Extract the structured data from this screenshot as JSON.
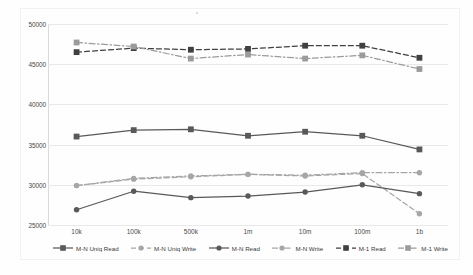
{
  "chart_data": {
    "type": "line",
    "title": "",
    "xlabel": "",
    "ylabel": "",
    "categories": [
      "10k",
      "100k",
      "500k",
      "1m",
      "10m",
      "100m",
      "1b"
    ],
    "ylim": [
      25000,
      50000
    ],
    "yticks": [
      25000,
      30000,
      35000,
      40000,
      45000,
      50000
    ],
    "ytick_labels": [
      "25000",
      "30000",
      "35000",
      "40000",
      "45000",
      "50000"
    ],
    "grid": true,
    "legend_position": "bottom",
    "series": [
      {
        "name": "M-N Uniq Read",
        "color": "#595959",
        "style": "solid",
        "marker": "square",
        "values": [
          36000,
          36800,
          36900,
          36100,
          36600,
          36100,
          34400
        ]
      },
      {
        "name": "M-N Uniq Write",
        "color": "#a6a6a6",
        "style": "dashed",
        "marker": "circle",
        "values": [
          29900,
          30700,
          31000,
          31300,
          31100,
          31400,
          26400
        ]
      },
      {
        "name": "M-N Read",
        "color": "#595959",
        "style": "solid",
        "marker": "circle",
        "values": [
          26900,
          29200,
          28400,
          28600,
          29100,
          30000,
          28900
        ]
      },
      {
        "name": "M-N Write",
        "color": "#a6a6a6",
        "style": "dashdot",
        "marker": "circle",
        "values": [
          29900,
          30800,
          31100,
          31300,
          31200,
          31500,
          31500
        ]
      },
      {
        "name": "M-1 Read",
        "color": "#404040",
        "style": "dashed",
        "marker": "square",
        "values": [
          46500,
          47000,
          46800,
          46900,
          47300,
          47300,
          45800
        ]
      },
      {
        "name": "M-1 Write",
        "color": "#9b9b9b",
        "style": "dashdot",
        "marker": "square",
        "values": [
          47700,
          47200,
          45700,
          46200,
          45700,
          46100,
          44400
        ]
      }
    ]
  },
  "legend": {
    "items": [
      {
        "label": "M-N Uniq Read"
      },
      {
        "label": "M-N Uniq Write"
      },
      {
        "label": "M-N Read"
      },
      {
        "label": "M-N Write"
      },
      {
        "label": "M-1 Read"
      },
      {
        "label": "M-1 Write"
      }
    ]
  }
}
